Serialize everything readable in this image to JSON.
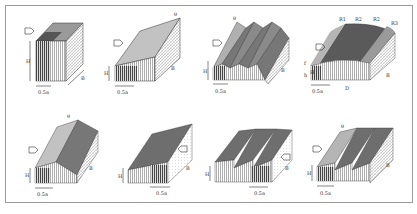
{
  "figure": {
    "panels": [
      {
        "id": "flat-box",
        "labels": {
          "height": "H",
          "depth": "B",
          "width": "0.5a"
        }
      },
      {
        "id": "mono-pitch",
        "labels": {
          "height": "H",
          "depth": "B",
          "width": "0.5a",
          "angle": "θ"
        }
      },
      {
        "id": "multi-span-pitched",
        "labels": {
          "height": "H",
          "depth": "B",
          "width": "0.5a",
          "angle": "θ"
        }
      },
      {
        "id": "curved-roof",
        "labels": {
          "height": "H",
          "rise": "f",
          "eave": "h",
          "depth": "B",
          "span": "D",
          "width": "0.5a",
          "zone1": "R1",
          "zone2": "R2",
          "zone2b": "R2",
          "zone3": "R3"
        }
      },
      {
        "id": "duo-pitch",
        "labels": {
          "height": "H",
          "depth": "B",
          "width": "0.5a",
          "angle": "θ"
        }
      },
      {
        "id": "mono-pitch-side-wind",
        "labels": {
          "height": "H",
          "depth": "B",
          "width": "0.5a"
        }
      },
      {
        "id": "sawtooth-side-wind",
        "labels": {
          "height": "H",
          "depth": "B",
          "width": "0.5a"
        }
      },
      {
        "id": "sawtooth",
        "labels": {
          "height": "H",
          "depth": "B",
          "width": "0.5a",
          "angle": "θ"
        }
      }
    ]
  },
  "colors": {
    "dark_roof": "#6e6e6e",
    "light_roof": "#b5b5b5",
    "very_dark": "#505050",
    "frame": "#9a9a9a"
  }
}
